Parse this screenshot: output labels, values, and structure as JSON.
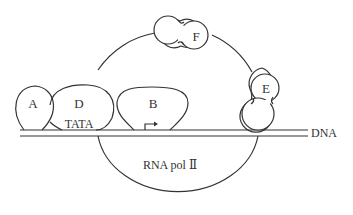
{
  "diagram": {
    "type": "transcription-initiation-complex",
    "line_color": "#333333",
    "background": "#ffffff",
    "labels": {
      "A": "A",
      "B": "B",
      "D": "D",
      "E": "E",
      "F": "F",
      "tata": "TATA",
      "dna": "DNA",
      "rna_pol": "RNA pol Ⅱ"
    },
    "elements": [
      {
        "id": "A",
        "shape": "teardrop",
        "label": "A"
      },
      {
        "id": "D",
        "shape": "oval",
        "label": "D"
      },
      {
        "id": "B",
        "shape": "dome",
        "label": "B"
      },
      {
        "id": "F",
        "shape": "double-circle",
        "label": "F"
      },
      {
        "id": "E",
        "shape": "stacked-circles",
        "label": "E"
      },
      {
        "id": "TATA",
        "shape": "text-on-dna",
        "label": "TATA"
      },
      {
        "id": "DNA",
        "shape": "double-line",
        "label": "DNA"
      },
      {
        "id": "RNA_pol_II",
        "shape": "large-loop",
        "label": "RNA pol Ⅱ"
      },
      {
        "id": "TSS",
        "shape": "bent-arrow",
        "label": ""
      }
    ]
  }
}
